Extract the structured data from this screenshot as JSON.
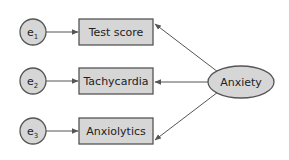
{
  "diagram": {
    "type": "structural-equation-model",
    "latent": {
      "id": "anxiety",
      "label": "Anxiety"
    },
    "indicators": [
      {
        "id": "test-score",
        "label": "Test score",
        "error": {
          "base": "e",
          "sub": "1"
        }
      },
      {
        "id": "tachycardia",
        "label": "Tachycardia",
        "error": {
          "base": "e",
          "sub": "2"
        }
      },
      {
        "id": "anxiolytics",
        "label": "Anxiolytics",
        "error": {
          "base": "e",
          "sub": "3"
        }
      }
    ],
    "edges": [
      {
        "from": "e1",
        "to": "test-score"
      },
      {
        "from": "e2",
        "to": "tachycardia"
      },
      {
        "from": "e3",
        "to": "anxiolytics"
      },
      {
        "from": "anxiety",
        "to": "test-score"
      },
      {
        "from": "anxiety",
        "to": "tachycardia"
      },
      {
        "from": "anxiety",
        "to": "anxiolytics"
      }
    ],
    "colors": {
      "fill": "#d6d6d6",
      "stroke": "#555555",
      "text": "#222222",
      "background": "#ffffff"
    }
  }
}
